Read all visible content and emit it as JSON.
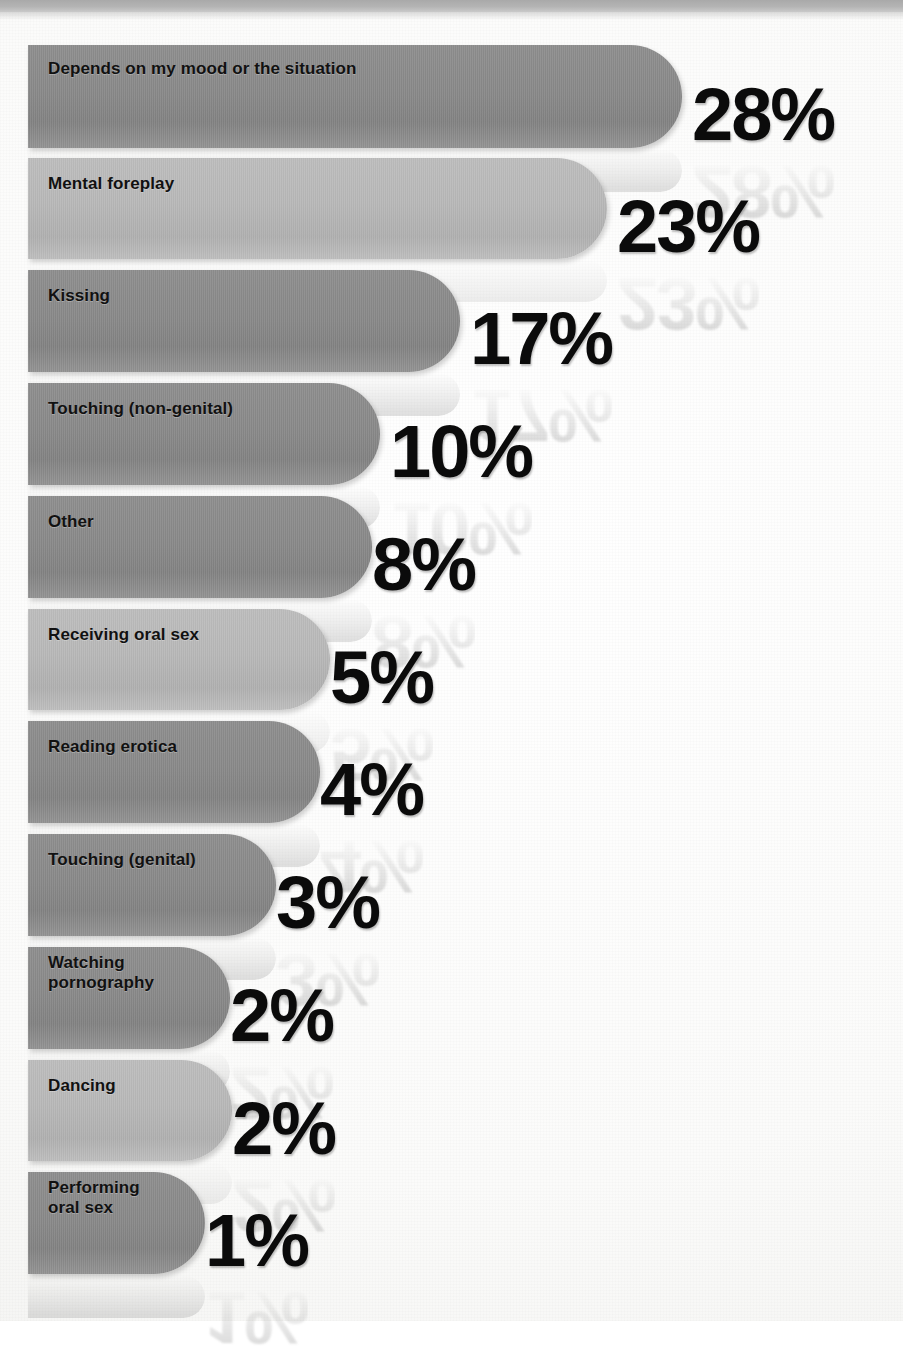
{
  "page": {
    "background_color": "#fbfbfa",
    "top_band_color": "#b4b4b4"
  },
  "colors": {
    "bar_dark": "#888888",
    "bar_light": "#b7b7b7",
    "value_text": "#0b0b0b",
    "label_text": "#111111"
  },
  "chart_data": {
    "type": "bar",
    "orientation": "horizontal",
    "title": "",
    "subtitle": "",
    "xlabel": "",
    "ylabel": "",
    "grid": false,
    "legend": false,
    "value_suffix": "%",
    "categories": [
      "Depends on my mood or the situation",
      "Mental foreplay",
      "Kissing",
      "Touching (non-genital)",
      "Other",
      "Receiving oral sex",
      "Reading erotica",
      "Touching (genital)",
      "Watching pornography",
      "Dancing",
      "Performing oral sex"
    ],
    "values": [
      28,
      23,
      17,
      10,
      8,
      5,
      4,
      3,
      2,
      2,
      1
    ],
    "value_labels": [
      "28%",
      "23%",
      "17%",
      "10%",
      "8%",
      "5%",
      "4%",
      "3%",
      "2%",
      "2%",
      "1%"
    ],
    "xlim": [
      0,
      28
    ]
  },
  "bars": [
    {
      "label": "Depends on my mood or the situation",
      "label_lines": "Depends on my mood or the situation",
      "value": 28,
      "value_label": "28%",
      "shade": "dark",
      "top": 45,
      "height": 103,
      "width": 654,
      "label_top": 59,
      "value_left": 692,
      "value_top": 78
    },
    {
      "label": "Mental foreplay",
      "label_lines": "Mental foreplay",
      "value": 23,
      "value_label": "23%",
      "shade": "light",
      "top": 158,
      "height": 101,
      "width": 579,
      "label_top": 174,
      "value_left": 617,
      "value_top": 190
    },
    {
      "label": "Kissing",
      "label_lines": "Kissing",
      "value": 17,
      "value_label": "17%",
      "shade": "dark",
      "top": 270,
      "height": 102,
      "width": 432,
      "label_top": 286,
      "value_left": 470,
      "value_top": 302
    },
    {
      "label": "Touching (non-genital)",
      "label_lines": "Touching (non-genital)",
      "value": 10,
      "value_label": "10%",
      "shade": "dark",
      "top": 383,
      "height": 102,
      "width": 352,
      "label_top": 399,
      "value_left": 390,
      "value_top": 415
    },
    {
      "label": "Other",
      "label_lines": "Other",
      "value": 8,
      "value_label": "8%",
      "shade": "dark",
      "top": 496,
      "height": 102,
      "width": 344,
      "label_top": 512,
      "value_left": 372,
      "value_top": 528
    },
    {
      "label": "Receiving oral sex",
      "label_lines": "Receiving oral sex",
      "value": 5,
      "value_label": "5%",
      "shade": "light",
      "top": 609,
      "height": 101,
      "width": 302,
      "label_top": 625,
      "value_left": 330,
      "value_top": 641
    },
    {
      "label": "Reading erotica",
      "label_lines": "Reading erotica",
      "value": 4,
      "value_label": "4%",
      "shade": "dark",
      "top": 721,
      "height": 102,
      "width": 292,
      "label_top": 737,
      "value_left": 320,
      "value_top": 753
    },
    {
      "label": "Touching (genital)",
      "label_lines": "Touching (genital)",
      "value": 3,
      "value_label": "3%",
      "shade": "dark",
      "top": 834,
      "height": 102,
      "width": 248,
      "label_top": 850,
      "value_left": 276,
      "value_top": 866
    },
    {
      "label": "Watching pornography",
      "label_lines": "Watching\npornography",
      "value": 2,
      "value_label": "2%",
      "shade": "dark",
      "top": 947,
      "height": 102,
      "width": 202,
      "label_top": 953,
      "value_left": 230,
      "value_top": 979
    },
    {
      "label": "Dancing",
      "label_lines": "Dancing",
      "value": 2,
      "value_label": "2%",
      "shade": "light",
      "top": 1060,
      "height": 101,
      "width": 204,
      "label_top": 1076,
      "value_left": 232,
      "value_top": 1092
    },
    {
      "label": "Performing oral sex",
      "label_lines": "Performing\noral sex",
      "value": 1,
      "value_label": "1%",
      "shade": "dark",
      "top": 1172,
      "height": 102,
      "width": 177,
      "label_top": 1178,
      "value_left": 205,
      "value_top": 1204
    }
  ]
}
